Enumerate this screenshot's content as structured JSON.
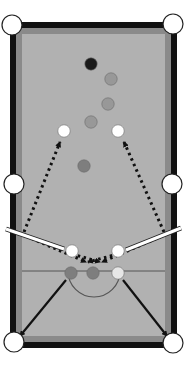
{
  "diagram": {
    "colors": {
      "background": "#ffffff",
      "frame": "#111111",
      "cushion": "#8a8a8a",
      "felt": "#b1b1b1",
      "pocket_fill": "#ffffff",
      "pocket_stroke": "#222222",
      "line": "#555555",
      "black_ball": "#1a1a1a",
      "gray_ball": "#989898",
      "dark_gray_ball": "#7e7e7e",
      "white_ball": "#ffffff",
      "light_ball": "#e6e6e6",
      "path": "#111111",
      "cue": "#ffffff"
    },
    "table": {
      "frame": {
        "x": 10,
        "y": 22,
        "w": 167,
        "h": 326
      },
      "cushion": {
        "x": 16,
        "y": 28,
        "w": 155,
        "h": 314
      },
      "felt": {
        "x": 22,
        "y": 34,
        "w": 143,
        "h": 302
      },
      "baulk_line": {
        "x1": 22,
        "x2": 165,
        "y": 271
      },
      "d_semicircle": {
        "cx": 94,
        "cy": 271,
        "r": 26
      }
    },
    "pockets": [
      {
        "name": "top-left",
        "cx": 12,
        "cy": 25
      },
      {
        "name": "top-right",
        "cx": 173,
        "cy": 24
      },
      {
        "name": "middle-left",
        "cx": 14,
        "cy": 184
      },
      {
        "name": "middle-right",
        "cx": 172,
        "cy": 184
      },
      {
        "name": "bottom-left",
        "cx": 14,
        "cy": 342
      },
      {
        "name": "bottom-right",
        "cx": 173,
        "cy": 343
      }
    ],
    "balls": [
      {
        "name": "black",
        "cx": 91,
        "cy": 64,
        "type": "black_ball"
      },
      {
        "name": "gray-1",
        "cx": 111,
        "cy": 79,
        "type": "gray_ball"
      },
      {
        "name": "gray-2",
        "cx": 108,
        "cy": 104,
        "type": "gray_ball"
      },
      {
        "name": "gray-3",
        "cx": 91,
        "cy": 122,
        "type": "gray_ball"
      },
      {
        "name": "white-target-left",
        "cx": 64,
        "cy": 131,
        "type": "white_ball"
      },
      {
        "name": "white-target-right",
        "cx": 118,
        "cy": 131,
        "type": "white_ball"
      },
      {
        "name": "gray-4",
        "cx": 84,
        "cy": 166,
        "type": "dark_gray_ball"
      },
      {
        "name": "white-cue-left",
        "cx": 72,
        "cy": 251,
        "type": "white_ball"
      },
      {
        "name": "white-cue-right",
        "cx": 118,
        "cy": 251,
        "type": "white_ball"
      },
      {
        "name": "baulk-ball-left",
        "cx": 71,
        "cy": 273,
        "type": "dark_gray_ball"
      },
      {
        "name": "baulk-ball-center",
        "cx": 93,
        "cy": 273,
        "type": "dark_gray_ball"
      },
      {
        "name": "baulk-ball-right",
        "cx": 118,
        "cy": 273,
        "type": "light_ball"
      }
    ],
    "cues": [
      {
        "name": "left-cue",
        "x1": 6,
        "y1": 229,
        "x2": 64,
        "y2": 249
      },
      {
        "name": "right-cue",
        "x1": 181,
        "y1": 228,
        "x2": 126,
        "y2": 250
      }
    ],
    "dotted_paths": [
      {
        "name": "left-path-up",
        "x1": 24,
        "y1": 232,
        "x2": 60,
        "y2": 142
      },
      {
        "name": "right-path-up",
        "x1": 164,
        "y1": 232,
        "x2": 124,
        "y2": 142
      },
      {
        "name": "left-path-down",
        "x1": 26,
        "y1": 236,
        "x2": 86,
        "y2": 262
      },
      {
        "name": "right-path-down",
        "x1": 162,
        "y1": 236,
        "x2": 102,
        "y2": 262
      },
      {
        "name": "left-cross",
        "x1": 72,
        "y1": 254,
        "x2": 100,
        "y2": 262
      },
      {
        "name": "right-cross",
        "x1": 118,
        "y1": 254,
        "x2": 88,
        "y2": 262
      }
    ],
    "solid_arrows": [
      {
        "name": "left-pot-arrow",
        "x1": 66,
        "y1": 280,
        "x2": 20,
        "y2": 336
      },
      {
        "name": "right-pot-arrow",
        "x1": 123,
        "y1": 280,
        "x2": 167,
        "y2": 336
      }
    ]
  }
}
